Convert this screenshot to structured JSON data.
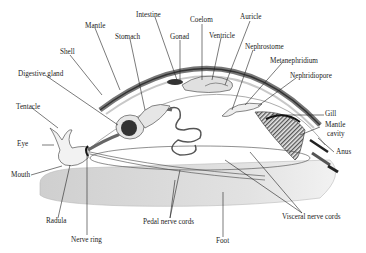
{
  "diagram": {
    "labels": {
      "intestine": "Intestine",
      "mantle": "Mantle",
      "stomach": "Stomach",
      "gonad": "Gonad",
      "coelom": "Coelom",
      "ventricle": "Ventricle",
      "auricle": "Auricle",
      "shell": "Shell",
      "nephrostome": "Nephrostome",
      "metanephridium": "Metanephridium",
      "digestive_gland": "Digestive gland",
      "nephridiopore": "Nephridiopore",
      "tentacle": "Tentacle",
      "gill": "Gill",
      "mantle_cavity_1": "Mantle",
      "mantle_cavity_2": "cavity",
      "eye": "Eye",
      "anus": "Anus",
      "mouth": "Mouth",
      "radula": "Radula",
      "pedal_nerve_cords": "Pedal nerve cords",
      "visceral_nerve_cords": "Visceral nerve cords",
      "foot": "Foot",
      "nerve_ring": "Nerve ring"
    },
    "colors": {
      "line": "#222222",
      "foot_fill": "#d9d9d9",
      "shell_fill": "#9a9a9a",
      "organ_fill": "#e6e6e6",
      "dark_organ": "#333333"
    }
  }
}
